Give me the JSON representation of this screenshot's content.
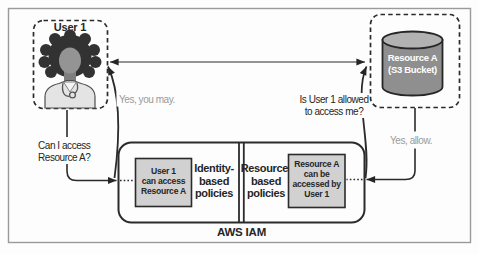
{
  "user_node": {
    "title": "User 1",
    "icon": "person-avatar-icon"
  },
  "resource_node": {
    "label_lines": [
      "Resource A",
      "(S3 Bucket)"
    ],
    "icon": "s3-bucket-cylinder-icon"
  },
  "iam_container": {
    "label": "AWS IAM",
    "identity_section": {
      "statement_lines": [
        "User 1",
        "can access",
        "Resource A"
      ],
      "policy_label_lines": [
        "Identity-",
        "based",
        "policies"
      ]
    },
    "resource_section": {
      "statement_lines": [
        "Resource A",
        "can be",
        "accessed by",
        "User 1"
      ],
      "policy_label_lines": [
        "Resource-",
        "based",
        "policies"
      ]
    }
  },
  "messages": {
    "user_question_lines": [
      "Can I access",
      "Resource A?"
    ],
    "answer_to_user": "Yes, you may.",
    "resource_question_lines": [
      "Is User 1 allowed",
      "to access me?"
    ],
    "answer_to_resource": "Yes, allow."
  },
  "colors": {
    "ink": "#262626",
    "muted_text": "#9a9a9a",
    "statement_box_fill": "#d1d1d1",
    "cylinder_body": "#8f8f8f",
    "cylinder_top": "#b2b2b2",
    "avatar_hair": "#323232",
    "avatar_skin": "#949494",
    "avatar_shirt": "#e4e4e4",
    "frame_border": "#9a9a9a",
    "background": "#fdfdfd"
  }
}
